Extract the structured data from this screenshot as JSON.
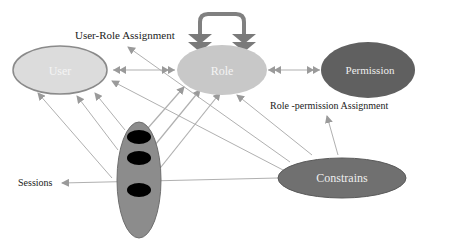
{
  "nodes": {
    "user": {
      "label": "User",
      "fill": "#dcdcdc",
      "text_color": "#f4f4f4"
    },
    "role": {
      "label": "Role",
      "fill": "#c8c8c8",
      "text_color": "#f4f4f4"
    },
    "permission": {
      "label": "Permission",
      "fill": "#606060",
      "text_color": "#eeeeee"
    },
    "constrains": {
      "label": "Constrains",
      "fill": "#707070",
      "text_color": "#eeeeee"
    },
    "sessions_node": {
      "fill": "#8c8c8c",
      "dot_color": "#000000"
    }
  },
  "labels": {
    "user_role_assignment": "User-Role Assignment",
    "role_permission_assignment": "Role -permission Assignment",
    "sessions": "Sessions"
  },
  "colors": {
    "edge": "#b0b0b0",
    "arrowhead": "#9a9a9a",
    "self_loop": "#808080"
  }
}
